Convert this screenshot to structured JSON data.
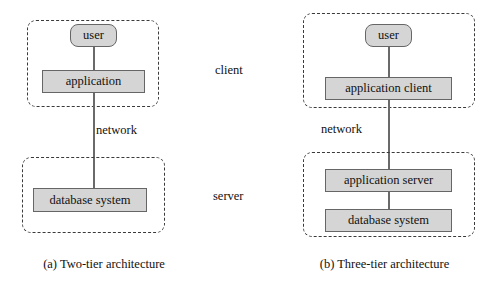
{
  "figure": {
    "tiers": {
      "client_label": "client",
      "server_label": "server"
    },
    "panels": [
      {
        "id": "two-tier",
        "caption": "(a) Two-tier architecture",
        "network_label": "network",
        "nodes": [
          {
            "id": "user",
            "label": "user",
            "shape": "rounded"
          },
          {
            "id": "application",
            "label": "application",
            "shape": "rect"
          },
          {
            "id": "database-system",
            "label": "database system",
            "shape": "rect"
          }
        ]
      },
      {
        "id": "three-tier",
        "caption": "(b)  Three-tier architecture",
        "network_label": "network",
        "nodes": [
          {
            "id": "user",
            "label": "user",
            "shape": "rounded"
          },
          {
            "id": "application-client",
            "label": "application client",
            "shape": "rect"
          },
          {
            "id": "application-server",
            "label": "application server",
            "shape": "rect"
          },
          {
            "id": "database-system",
            "label": "database system",
            "shape": "rect"
          }
        ]
      }
    ],
    "colors": {
      "node_fill": "#d5d5d5",
      "node_stroke": "#666666",
      "tier_stroke": "#3a3a3a",
      "link_stroke": "#6a6a6a",
      "text": "#111111",
      "background": "#ffffff"
    }
  }
}
